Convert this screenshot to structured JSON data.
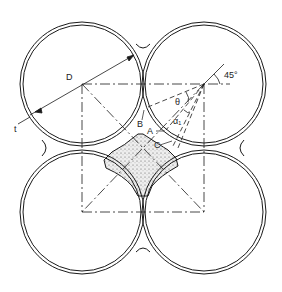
{
  "diagram": {
    "labels": {
      "D": "D",
      "t": "t",
      "angle45": "45°",
      "theta": "θ",
      "alpha1": "α₁",
      "A": "A",
      "B": "B",
      "C": "C"
    },
    "colors": {
      "line": "#1a1a1a",
      "fill_region": "#e6e6e6",
      "background": "#ffffff"
    }
  }
}
